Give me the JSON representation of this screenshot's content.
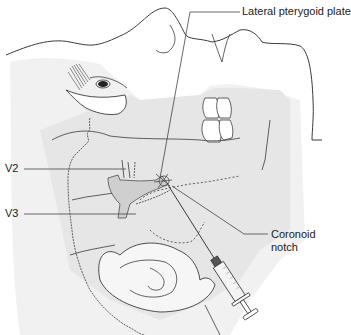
{
  "figure": {
    "labels": {
      "lateral_pterygoid_plate": "Lateral pterygoid plate",
      "v2": "V2",
      "v3": "V3",
      "coronoid_notch_line1": "Coronoid",
      "coronoid_notch_line2": "notch"
    },
    "colors": {
      "outline": "#3a3a3a",
      "shade_light": "#eeeeee",
      "shade_mid": "#e2e2e2",
      "nerve_fill": "#cfcfcf",
      "leader_line": "#444444",
      "background": "#ffffff"
    }
  }
}
